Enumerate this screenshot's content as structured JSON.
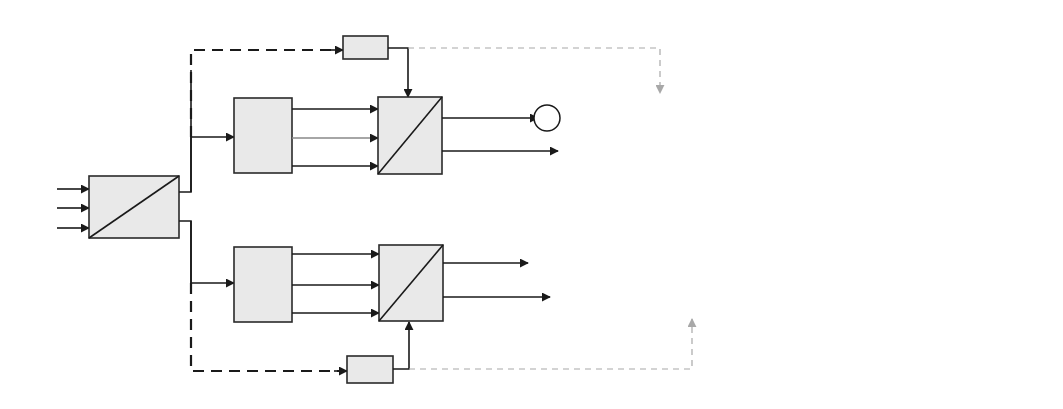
{
  "diagram": {
    "inputs": [
      {
        "main": "V",
        "sub": "ab"
      },
      {
        "main": "V",
        "sub": "bc"
      },
      {
        "main": "V",
        "sub": "ca"
      }
    ],
    "seq_block": {
      "top": "abc",
      "bottom": "012"
    },
    "seq_outputs": [
      {
        "main": "V",
        "sub": "1_ab"
      },
      {
        "main": "V",
        "sub": "2_ab"
      }
    ],
    "theta_blocks": [
      "θ_1",
      "θ_2"
    ],
    "transform_blocks": [
      "[T1]",
      "[T2]"
    ],
    "upper": {
      "t_outputs": [
        {
          "main": "V",
          "sub": "1_ab"
        },
        {
          "main": "V",
          "sub": "1_bc"
        },
        {
          "main": "V",
          "sub": "1_ca"
        }
      ],
      "park": {
        "top": "abc",
        "bottom": "dq"
      },
      "dq_signals": [
        {
          "main": "V",
          "sub": "1_d"
        },
        {
          "main": "V",
          "sub": "1_q"
        }
      ],
      "refs": [
        {
          "main": "V",
          "sub": "d_ref"
        },
        {
          "main": "V",
          "sub": "q_ref"
        }
      ],
      "sum_d_signs": [
        "+",
        "−"
      ],
      "sum_q_signs": [
        "−",
        "+"
      ],
      "errors_dq": [
        {
          "main": "err",
          "sub": "1_d"
        },
        {
          "main": "err",
          "sub": "1_q"
        }
      ],
      "inv_park": {
        "top": "dq",
        "bottom": "abc"
      },
      "errors_abc": [
        {
          "main": "err",
          "sub": "1_ab"
        },
        {
          "main": "err",
          "sub": "1_bc"
        },
        {
          "main": "err",
          "sub": "1_ca"
        }
      ],
      "gain": {
        "num": "1",
        "den_prefix": "1−",
        "den_var": "a",
        "den_exp": "2"
      }
    },
    "lower": {
      "t_outputs": [
        {
          "main": "V",
          "sub": "2_ab"
        },
        {
          "main": "V",
          "sub": "2_bc"
        },
        {
          "main": "V",
          "sub": "2_ca"
        }
      ],
      "park": {
        "top": "abc",
        "bottom": "dq"
      },
      "dq_signals": [
        {
          "main": "V",
          "sub": "2_d"
        },
        {
          "main": "V",
          "sub": "2_q"
        }
      ],
      "refs": [
        {
          "main": "V",
          "sub": "d_ref"
        },
        {
          "main": "V",
          "sub": "q_ref"
        }
      ],
      "sum_d_signs": [
        "+",
        "−"
      ],
      "sum_q_signs": [
        "−",
        "+"
      ],
      "errors_dq": [
        {
          "main": "err",
          "sub": "2_d"
        },
        {
          "main": "err",
          "sub": "1_q"
        }
      ],
      "inv_park": {
        "top": "dq",
        "bottom": "abc"
      },
      "errors_abc": [
        {
          "main": "err",
          "sub": "2_ab"
        },
        {
          "main": "err",
          "sub": "2_bc"
        },
        {
          "main": "err",
          "sub": "2_ca"
        }
      ],
      "gain": {
        "num": "1",
        "den_prefix": "1−",
        "den_var": "a",
        "den_exp": "2"
      }
    },
    "section_labels": [
      {
        "main": "Ref",
        "sub": "line"
      },
      {
        "main": "Ref",
        "sub": "phase"
      }
    ],
    "output_sum_signs": [
      "+",
      "+"
    ],
    "outputs": [
      {
        "main": "V",
        "sub": "dvr_ab"
      },
      {
        "main": "V",
        "sub": "dvr_bc"
      },
      {
        "main": "V",
        "sub": "dvr_ca"
      }
    ]
  }
}
